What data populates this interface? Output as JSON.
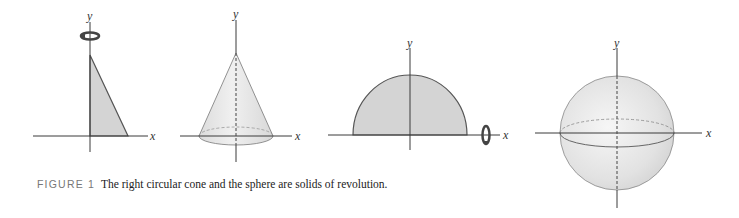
{
  "caption": {
    "label": "FIGURE 1",
    "text": "The right circular cone and the sphere are solids of revolution."
  },
  "panels": [
    {
      "id": "triangle",
      "x_label": "x",
      "y_label": "y",
      "description": "Right triangle region rotated about y-axis",
      "rotation_axis": "y"
    },
    {
      "id": "cone",
      "x_label": "x",
      "y_label": "y",
      "description": "Right circular cone solid of revolution"
    },
    {
      "id": "semicircle",
      "x_label": "x",
      "y_label": "y",
      "description": "Semicircular region rotated about x-axis",
      "rotation_axis": "x"
    },
    {
      "id": "sphere",
      "x_label": "x",
      "y_label": "y",
      "description": "Sphere solid of revolution"
    }
  ],
  "colors": {
    "fill_region": "#d4d4d4",
    "solid_fill": "#e6e6e6",
    "outline": "#555555",
    "rotation_arrow": "#444444",
    "caption_label": "#777777"
  }
}
